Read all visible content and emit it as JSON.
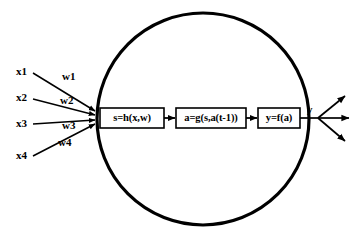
{
  "diagram": {
    "background_color": "#ffffff",
    "stroke_color": "#000000",
    "body": {
      "shape": "circle",
      "name": "neuron-body",
      "cx": 203,
      "cy": 119,
      "r": 106
    },
    "inputs": [
      {
        "label": "x1",
        "label_x": 16,
        "label_y": 72,
        "line_x1": 33,
        "line_y1": 73,
        "line_x2": 95,
        "line_y2": 111
      },
      {
        "label": "x2",
        "label_x": 16,
        "label_y": 98,
        "line_x1": 33,
        "line_y1": 99,
        "line_x2": 95,
        "line_y2": 115
      },
      {
        "label": "x3",
        "label_x": 16,
        "label_y": 124,
        "line_x1": 33,
        "line_y1": 124,
        "line_x2": 95,
        "line_y2": 120
      },
      {
        "label": "x4",
        "label_x": 16,
        "label_y": 156,
        "line_x1": 33,
        "line_y1": 156,
        "line_x2": 95,
        "line_y2": 124
      }
    ],
    "weights": [
      {
        "label": "w1",
        "x": 62,
        "y": 77
      },
      {
        "label": "w2",
        "x": 60,
        "y": 101
      },
      {
        "label": "w3",
        "x": 62,
        "y": 126
      },
      {
        "label": "w4",
        "x": 58,
        "y": 143
      }
    ],
    "boxes": [
      {
        "name": "state-function-box",
        "label": "s=h(x,w)",
        "x": 100,
        "y": 108,
        "w": 64,
        "h": 20
      },
      {
        "name": "activation-function-box",
        "label": "a=g(s,a(t-1))",
        "x": 176,
        "y": 108,
        "w": 70,
        "h": 20
      },
      {
        "name": "output-function-box",
        "label": "y=f(a)",
        "x": 258,
        "y": 108,
        "w": 42,
        "h": 20
      }
    ],
    "flow_arrows": [
      {
        "name": "state-to-activation-arrow",
        "x1": 164,
        "y1": 118,
        "x2": 175,
        "y2": 118
      },
      {
        "name": "activation-to-output-arrow",
        "x1": 246,
        "y1": 118,
        "x2": 257,
        "y2": 118
      }
    ],
    "output": {
      "label": "y",
      "label_x": 307,
      "label_y": 110,
      "stem": {
        "x1": 300,
        "y1": 118,
        "x2": 318,
        "y2": 118
      },
      "branches": [
        {
          "name": "output-branch-up",
          "x1": 318,
          "y1": 118,
          "x2": 345,
          "y2": 96
        },
        {
          "name": "output-branch-right",
          "x1": 318,
          "y1": 118,
          "x2": 349,
          "y2": 118
        },
        {
          "name": "output-branch-down",
          "x1": 318,
          "y1": 118,
          "x2": 345,
          "y2": 141
        }
      ]
    }
  }
}
